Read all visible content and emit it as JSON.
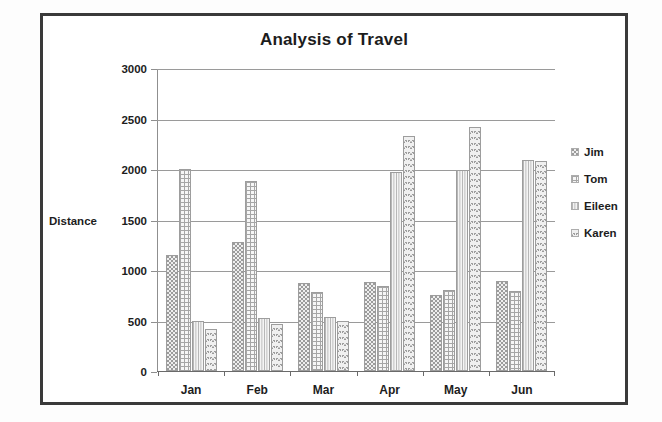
{
  "chart_data": {
    "type": "bar",
    "title": "Analysis of Travel",
    "xlabel": "",
    "ylabel": "Distance",
    "categories": [
      "Jan",
      "Feb",
      "Mar",
      "Apr",
      "May",
      "Jun"
    ],
    "series": [
      {
        "name": "Jim",
        "pattern": "dots",
        "values": [
          1150,
          1280,
          870,
          880,
          750,
          890
        ]
      },
      {
        "name": "Tom",
        "pattern": "grid",
        "values": [
          2000,
          1880,
          780,
          840,
          800,
          790
        ]
      },
      {
        "name": "Eileen",
        "pattern": "vlines",
        "values": [
          500,
          520,
          530,
          1970,
          1995,
          2090
        ]
      },
      {
        "name": "Karen",
        "pattern": "scale",
        "values": [
          420,
          470,
          500,
          2330,
          2420,
          2080
        ]
      }
    ],
    "ylim": [
      0,
      3000
    ],
    "yticks": [
      0,
      500,
      1000,
      1500,
      2000,
      2500,
      3000
    ],
    "ytick_labels": [
      "0",
      "500",
      "1000",
      "1500",
      "2000",
      "2500",
      "3000"
    ],
    "grid": true,
    "legend_position": "right",
    "colors": {
      "gridline": "#9a9a9a",
      "axis": "#6a6a6a",
      "text": "#1d1d1d",
      "frame": "#3a3a3a",
      "background": "#ffffff"
    }
  }
}
